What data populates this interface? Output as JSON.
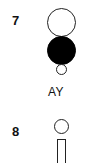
{
  "figures": [
    {
      "number": "7",
      "label": "AY",
      "glyphs": [
        "large-open-circle",
        "large-filled-circle",
        "small-open-circle"
      ]
    },
    {
      "number": "8",
      "label": "",
      "glyphs": [
        "small-open-circle",
        "open-rectangle"
      ]
    }
  ],
  "colors": {
    "stroke": "#222222",
    "fill": "#000000",
    "background": "#ffffff"
  }
}
